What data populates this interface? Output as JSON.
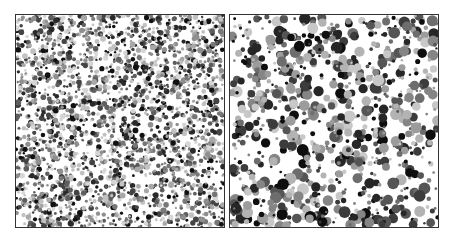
{
  "figure": {
    "panels": [
      {
        "id": "left",
        "description": "Dense packing of small polydisperse grayscale discs",
        "disc_count": 2600,
        "radius_min": 1.2,
        "radius_max": 3.0,
        "seed": 17,
        "gray_levels": [
          "#111111",
          "#2a2a2a",
          "#444444",
          "#5e5e5e",
          "#777777",
          "#8f8f8f",
          "#a8a8a8",
          "#c2c2c2",
          "#d6d6d6"
        ]
      },
      {
        "id": "right",
        "description": "Sparser packing of larger polydisperse grayscale discs",
        "disc_count": 900,
        "radius_min": 1.2,
        "radius_max": 6.0,
        "seed": 53,
        "gray_levels": [
          "#0e0e0e",
          "#262626",
          "#3c3c3c",
          "#555555",
          "#6d6d6d",
          "#858585",
          "#9c9c9c",
          "#b3b3b3",
          "#c8c8c8"
        ]
      }
    ],
    "border_color": "#333333",
    "background_color": "#ffffff"
  }
}
